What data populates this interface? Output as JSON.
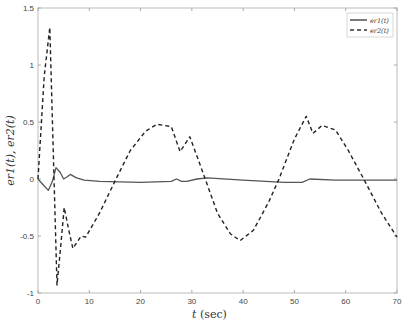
{
  "chart_data": {
    "type": "line",
    "title": "",
    "xlabel": "t (sec)",
    "ylabel": "e_{r1}(t), e_{r2}(t)",
    "xlim": [
      0,
      70
    ],
    "ylim": [
      -1,
      1.5
    ],
    "xticks": [
      0,
      10,
      20,
      30,
      40,
      50,
      60,
      70
    ],
    "yticks": [
      -1,
      -0.5,
      0,
      0.5,
      1,
      1.5
    ],
    "xtick_labels": [
      "0",
      "10",
      "20",
      "30",
      "40",
      "50",
      "60",
      "70"
    ],
    "ytick_labels": [
      "-1",
      "-0.5",
      "0",
      "0.5",
      "1",
      "1.5"
    ],
    "grid": false,
    "legend_position": "upper right",
    "series": [
      {
        "name": "e_{r1}(t)",
        "style": "solid",
        "color": "#555555",
        "x": [
          0,
          1,
          2,
          2.8,
          3.5,
          4.3,
          5,
          5.7,
          6.3,
          7.5,
          9,
          12,
          20,
          26,
          27,
          28,
          29,
          31,
          33,
          40,
          48,
          50,
          51.5,
          53,
          58,
          65,
          70
        ],
        "y": [
          0,
          -0.05,
          -0.1,
          -0.02,
          0.1,
          0.06,
          0.0,
          0.02,
          0.04,
          0.01,
          -0.01,
          -0.02,
          -0.03,
          -0.02,
          0.0,
          -0.02,
          -0.02,
          0.0,
          0.01,
          -0.01,
          -0.03,
          -0.03,
          -0.03,
          0.0,
          -0.01,
          -0.01,
          -0.01
        ]
      },
      {
        "name": "e_{r2}(t)",
        "style": "dashed",
        "color": "#222222",
        "x": [
          0,
          1.2,
          2.3,
          3.0,
          3.7,
          4.4,
          5.1,
          6.0,
          6.8,
          8.4,
          9.3,
          12,
          15.2,
          18,
          21,
          23.2,
          26,
          27.7,
          29.6,
          31,
          32.6,
          35,
          37.5,
          39.4,
          42,
          45,
          47,
          50,
          52.3,
          53.6,
          55.4,
          58,
          60.5,
          63.5,
          67,
          70
        ],
        "y": [
          0,
          0.9,
          1.33,
          0.2,
          -0.93,
          -0.6,
          -0.25,
          -0.45,
          -0.61,
          -0.5,
          -0.51,
          -0.3,
          0.0,
          0.25,
          0.42,
          0.48,
          0.46,
          0.24,
          0.37,
          0.2,
          0.0,
          -0.3,
          -0.48,
          -0.54,
          -0.45,
          -0.2,
          0.0,
          0.35,
          0.55,
          0.4,
          0.47,
          0.43,
          0.25,
          0.0,
          -0.3,
          -0.51
        ]
      }
    ]
  },
  "legend": {
    "items": [
      {
        "label": "e_{r1}(t)",
        "style": "solid"
      },
      {
        "label": "e_{r2}(t)",
        "style": "dashed"
      }
    ]
  },
  "axes": {
    "xlabel_main": "t",
    "xlabel_unit": "(sec)",
    "ylabel": "e_{r1}(t),  e_{r2}(t)"
  }
}
